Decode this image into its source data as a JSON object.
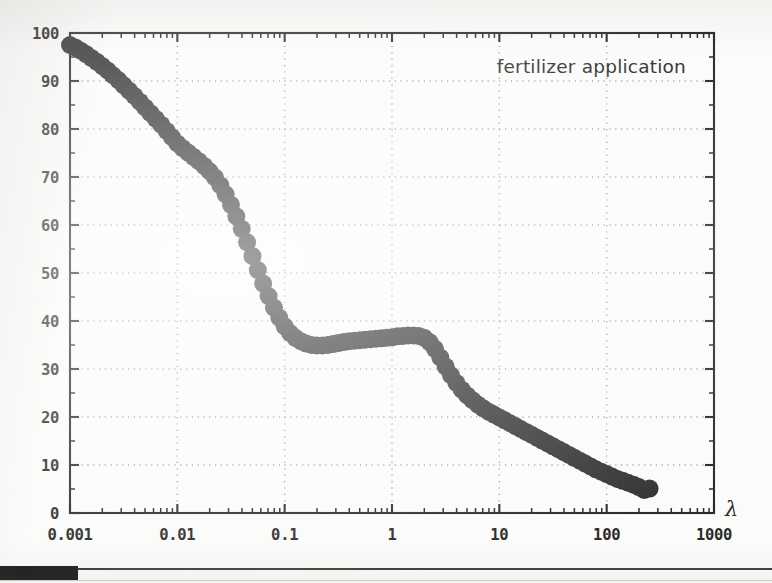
{
  "chart_data": {
    "type": "line",
    "title": "",
    "annotation": "fertilizer application",
    "xlabel": "λ",
    "ylabel": "",
    "xscale": "log",
    "yscale": "linear",
    "xlim": [
      0.001,
      1000
    ],
    "ylim": [
      0,
      100
    ],
    "grid": true,
    "legend": "none",
    "marker": "filled-circle",
    "marker_color": "#333333",
    "xticks": [
      "0.001",
      "0.01",
      "0.1",
      "1",
      "10",
      "100",
      "1000"
    ],
    "xtick_values": [
      0.001,
      0.01,
      0.1,
      1,
      10,
      100,
      1000
    ],
    "yticks": [
      "0",
      "10",
      "20",
      "30",
      "40",
      "50",
      "60",
      "70",
      "80",
      "90",
      "100"
    ],
    "ytick_values": [
      0,
      10,
      20,
      30,
      40,
      50,
      60,
      70,
      80,
      90,
      100
    ],
    "x": [
      0.001,
      0.00112,
      0.00126,
      0.00141,
      0.00158,
      0.00178,
      0.002,
      0.00224,
      0.00251,
      0.00282,
      0.00316,
      0.00355,
      0.00398,
      0.00447,
      0.00501,
      0.00562,
      0.00631,
      0.00708,
      0.00794,
      0.00891,
      0.01,
      0.01122,
      0.01259,
      0.01413,
      0.01585,
      0.01778,
      0.01995,
      0.02239,
      0.02512,
      0.02818,
      0.03162,
      0.03548,
      0.03981,
      0.04467,
      0.05012,
      0.05623,
      0.0631,
      0.07079,
      0.07943,
      0.08913,
      0.1,
      0.1122,
      0.12589,
      0.14125,
      0.15849,
      0.17783,
      0.19953,
      0.22387,
      0.25119,
      0.28184,
      0.31623,
      0.35481,
      0.39811,
      0.44668,
      0.50119,
      0.56234,
      0.63096,
      0.70795,
      0.79433,
      0.89125,
      1.0,
      1.12202,
      1.25893,
      1.41254,
      1.58489,
      1.77828,
      1.99526,
      2.23872,
      2.51189,
      2.81838,
      3.16228,
      3.54813,
      3.98107,
      4.46684,
      5.01187,
      5.62341,
      6.30957,
      7.07946,
      7.94328,
      8.91251,
      10.0,
      11.2202,
      12.5893,
      14.1254,
      15.8489,
      17.7828,
      19.9526,
      22.3872,
      25.1189,
      28.1838,
      31.6228,
      35.4813,
      39.8107,
      44.6684,
      50.1187,
      56.2341,
      63.0957,
      70.7946,
      79.4328,
      89.1251,
      100.0,
      112.202,
      125.893,
      141.254,
      158.489,
      177.828,
      199.526,
      223.872,
      251.189
    ],
    "y": [
      97.5,
      97.0,
      96.3,
      95.6,
      94.8,
      94.0,
      93.1,
      92.2,
      91.2,
      90.2,
      89.1,
      88.0,
      86.9,
      85.7,
      84.5,
      83.3,
      82.1,
      80.9,
      79.6,
      78.3,
      77.0,
      76.0,
      75.1,
      74.2,
      73.3,
      72.3,
      71.2,
      69.9,
      68.3,
      66.4,
      64.2,
      61.8,
      59.2,
      56.4,
      53.5,
      50.6,
      47.8,
      45.2,
      42.8,
      40.7,
      38.9,
      37.5,
      36.5,
      35.8,
      35.3,
      35.0,
      34.9,
      34.9,
      35.0,
      35.2,
      35.4,
      35.6,
      35.8,
      35.9,
      36.0,
      36.1,
      36.2,
      36.3,
      36.4,
      36.5,
      36.6,
      36.8,
      36.9,
      37.0,
      37.0,
      36.9,
      36.5,
      35.6,
      34.2,
      32.4,
      30.5,
      28.7,
      27.1,
      25.7,
      24.5,
      23.5,
      22.6,
      21.8,
      21.1,
      20.5,
      19.9,
      19.3,
      18.7,
      18.1,
      17.5,
      16.9,
      16.3,
      15.7,
      15.1,
      14.5,
      13.9,
      13.3,
      12.7,
      12.1,
      11.5,
      10.9,
      10.3,
      9.7,
      9.1,
      8.6,
      8.1,
      7.6,
      7.1,
      6.7,
      6.3,
      5.9,
      5.4,
      4.8,
      5.1
    ]
  },
  "chart_meta": {
    "marker_radius_px": 9,
    "axis_color": "#2b2b2b",
    "grid_color": "#8c8c86",
    "background_color": "#fbfbf9"
  },
  "page": {
    "bottom_strip_present": true
  }
}
